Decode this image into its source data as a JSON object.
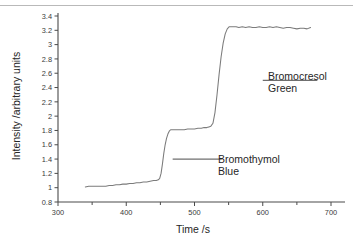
{
  "chart_data": {
    "type": "line",
    "title": "",
    "xlabel": "Time  /s",
    "ylabel": "Intensity  /arbitrary units",
    "xlim": [
      300,
      700
    ],
    "ylim": [
      0.8,
      3.4
    ],
    "xticks": [
      300,
      400,
      500,
      600,
      700
    ],
    "xtick_labels": [
      "300",
      "400",
      "500",
      "600",
      "700"
    ],
    "xtick_minor_step": 50,
    "yticks": [
      0.8,
      1,
      1.2,
      1.4,
      1.6,
      1.8,
      2,
      2.2,
      2.4,
      2.6,
      2.8,
      3,
      3.2,
      3.4
    ],
    "ytick_labels": [
      "0.8",
      "1",
      "1.2",
      "1.4",
      "1.6",
      "1.8",
      "2",
      "2.2",
      "2.4",
      "2.6",
      "2.8",
      "3",
      "3.2",
      "3.4"
    ],
    "grid": false,
    "legend_position": "none",
    "line_color": "#7b7b7b",
    "axis_color": "#4a4a4a",
    "series": [
      {
        "name": "Intensity trace",
        "x": [
          340,
          345,
          350,
          355,
          360,
          365,
          370,
          375,
          380,
          385,
          390,
          395,
          400,
          405,
          410,
          415,
          420,
          425,
          430,
          435,
          440,
          444,
          447,
          449,
          451,
          453,
          455,
          457,
          459,
          461,
          463,
          465,
          468,
          472,
          476,
          480,
          485,
          490,
          495,
          500,
          505,
          510,
          514,
          518,
          521,
          524,
          527,
          530,
          533,
          536,
          539,
          542,
          545,
          548,
          551,
          554,
          557,
          561,
          565,
          570,
          575,
          580,
          585,
          590,
          595,
          600,
          605,
          610,
          615,
          620,
          625,
          630,
          635,
          640,
          645,
          650,
          655,
          660,
          665,
          670
        ],
        "y": [
          1.01,
          1.02,
          1.02,
          1.02,
          1.02,
          1.02,
          1.02,
          1.03,
          1.03,
          1.04,
          1.04,
          1.05,
          1.05,
          1.06,
          1.06,
          1.07,
          1.07,
          1.08,
          1.08,
          1.09,
          1.1,
          1.1,
          1.11,
          1.13,
          1.2,
          1.33,
          1.48,
          1.6,
          1.69,
          1.75,
          1.79,
          1.81,
          1.81,
          1.81,
          1.81,
          1.81,
          1.81,
          1.82,
          1.82,
          1.82,
          1.83,
          1.83,
          1.84,
          1.84,
          1.85,
          1.86,
          1.9,
          2.05,
          2.3,
          2.58,
          2.83,
          3.02,
          3.15,
          3.22,
          3.25,
          3.25,
          3.25,
          3.25,
          3.24,
          3.25,
          3.24,
          3.25,
          3.24,
          3.24,
          3.25,
          3.24,
          3.24,
          3.25,
          3.24,
          3.25,
          3.24,
          3.23,
          3.24,
          3.24,
          3.23,
          3.22,
          3.23,
          3.23,
          3.22,
          3.24
        ]
      }
    ],
    "annotations": [
      {
        "id": "bromocresol-green",
        "label_line1": "Bromocresol",
        "label_line2": "Green",
        "leader_x_start": 600,
        "leader_x_end": 680,
        "leader_y": 2.5
      },
      {
        "id": "bromothymol-blue",
        "label_line1": "Bromothymol",
        "label_line2": "Blue",
        "leader_x_start": 468,
        "leader_x_end": 540,
        "leader_y": 1.4
      }
    ]
  }
}
